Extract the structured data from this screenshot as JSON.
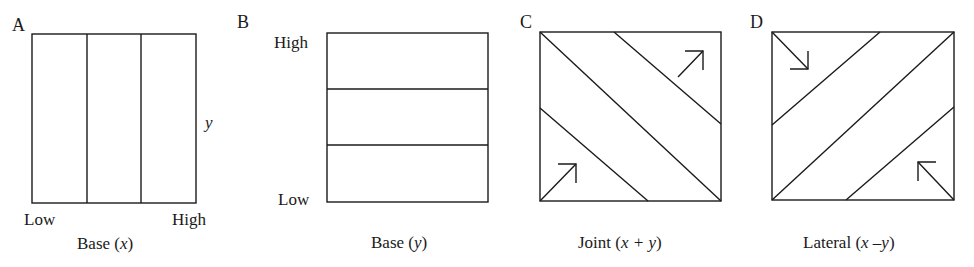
{
  "figure": {
    "stroke_color": "#1a1a1a",
    "panels": [
      {
        "id": "A",
        "letter": "A",
        "axis_label_y": "y",
        "low_label": "Low",
        "high_label": "High",
        "caption_word": "Base",
        "caption_paren_open": "(",
        "caption_var": "x",
        "caption_paren_close": ")",
        "division": "vertical",
        "bands": 3
      },
      {
        "id": "B",
        "letter": "B",
        "high_label": "High",
        "low_label": "Low",
        "caption_word": "Base",
        "caption_paren_open": "(",
        "caption_var": "y",
        "caption_paren_close": ")",
        "division": "horizontal",
        "bands": 3
      },
      {
        "id": "C",
        "letter": "C",
        "caption_word": "Joint",
        "caption_paren_open": "(",
        "caption_var": "x + y",
        "caption_paren_close": ")",
        "division": "diagonal-descending",
        "arrows": [
          "northeast",
          "northeast"
        ]
      },
      {
        "id": "D",
        "letter": "D",
        "caption_word": "Lateral",
        "caption_paren_open": "(",
        "caption_var": "x –y",
        "caption_paren_close": ")",
        "division": "diagonal-ascending",
        "arrows": [
          "southeast",
          "northwest"
        ]
      }
    ]
  }
}
